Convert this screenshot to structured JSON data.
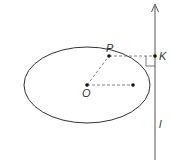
{
  "diagram": {
    "labels": {
      "P": "P",
      "K": "K",
      "O": "O",
      "l": "l"
    },
    "ellipse": {
      "cx": 87,
      "cy": 85,
      "rx": 63,
      "ry": 38
    },
    "points": {
      "O": [
        87,
        85
      ],
      "P": [
        109,
        56
      ],
      "K": [
        155,
        56
      ],
      "vertex": [
        133,
        85
      ]
    },
    "line_l": {
      "x": 155,
      "y_top": 4,
      "y_bottom": 160,
      "arrow": "up"
    },
    "colors": {
      "stroke": "#333333",
      "dashed": "#555555",
      "background": "#ffffff"
    }
  }
}
